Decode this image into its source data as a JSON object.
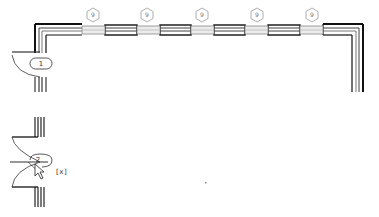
{
  "drawing": {
    "type": "floor-plan",
    "window_tags": [
      {
        "label": "9",
        "x": 93
      },
      {
        "label": "9",
        "x": 147
      },
      {
        "label": "9",
        "x": 202
      },
      {
        "label": "9",
        "x": 257
      },
      {
        "label": "9",
        "x": 312
      }
    ],
    "door_tags": [
      {
        "label": "1"
      },
      {
        "label": "2"
      }
    ],
    "cursor_badge": "[x]",
    "colors": {
      "wall": "#111111",
      "window_fill": "#e6e6e6",
      "tag_stroke": "#9a9a9a",
      "background": "#ffffff"
    }
  }
}
